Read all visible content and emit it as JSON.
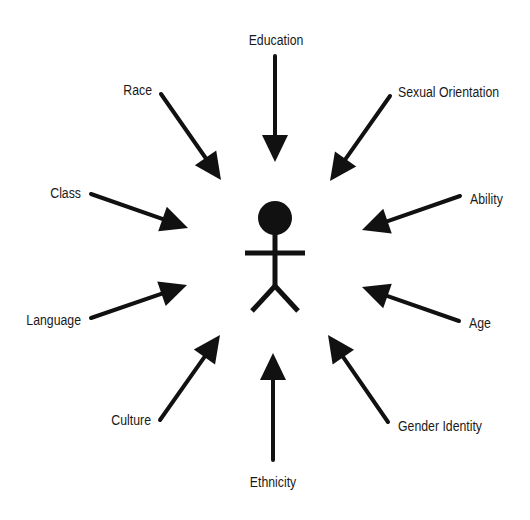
{
  "diagram": {
    "type": "radial-influence-diagram",
    "center": {
      "label": "",
      "icon": "stick-figure-person-icon",
      "cx": 275,
      "cy": 218
    },
    "colors": {
      "ink": "#111111",
      "text": "#1a1a1a",
      "background": "#ffffff"
    },
    "factors": [
      {
        "id": "education",
        "label": "Education",
        "lx": 276,
        "ly": 45,
        "anchor": "middle",
        "x1": 275,
        "y1": 56,
        "x2": 275,
        "y2": 162
      },
      {
        "id": "sexual-orientation",
        "label": "Sexual Orientation",
        "lx": 398,
        "ly": 97,
        "anchor": "start",
        "x1": 390,
        "y1": 96,
        "x2": 330,
        "y2": 181
      },
      {
        "id": "ability",
        "label": "Ability",
        "lx": 470,
        "ly": 204,
        "anchor": "start",
        "x1": 460,
        "y1": 196,
        "x2": 362,
        "y2": 230
      },
      {
        "id": "age",
        "label": "Age",
        "lx": 469,
        "ly": 328,
        "anchor": "start",
        "x1": 459,
        "y1": 321,
        "x2": 362,
        "y2": 287
      },
      {
        "id": "gender-identity",
        "label": "Gender Identity",
        "lx": 398,
        "ly": 431,
        "anchor": "start",
        "x1": 388,
        "y1": 422,
        "x2": 328,
        "y2": 335
      },
      {
        "id": "ethnicity",
        "label": "Ethnicity",
        "lx": 273,
        "ly": 487,
        "anchor": "middle",
        "x1": 273,
        "y1": 460,
        "x2": 273,
        "y2": 353
      },
      {
        "id": "culture",
        "label": "Culture",
        "lx": 151,
        "ly": 425,
        "anchor": "end",
        "x1": 160,
        "y1": 420,
        "x2": 220,
        "y2": 335
      },
      {
        "id": "language",
        "label": "Language",
        "lx": 81,
        "ly": 325,
        "anchor": "end",
        "x1": 91,
        "y1": 318,
        "x2": 187,
        "y2": 285
      },
      {
        "id": "class",
        "label": "Class",
        "lx": 81,
        "ly": 198,
        "anchor": "end",
        "x1": 91,
        "y1": 194,
        "x2": 188,
        "y2": 228
      },
      {
        "id": "race",
        "label": "Race",
        "lx": 152,
        "ly": 95,
        "anchor": "end",
        "x1": 161,
        "y1": 94,
        "x2": 221,
        "y2": 180
      }
    ]
  }
}
